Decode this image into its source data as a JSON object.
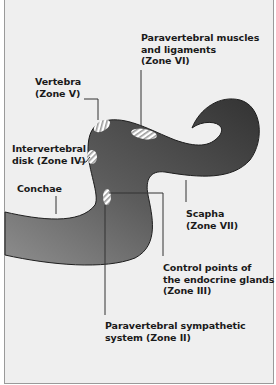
{
  "labels": {
    "zone_vi": "Paravertebral muscles\nand ligaments\n(Zone VI)",
    "zone_v": "Vertebra\n(Zone V)",
    "zone_iv": "Intervertebral\ndisk (Zone IV)",
    "conchae": "Conchae",
    "zone_vii": "Scapha\n(Zone VII)",
    "zone_iii": "Control points of\nthe endocrine glands\n(Zone III)",
    "zone_ii": "Paravertebral sympathetic\nsystem (Zone II)"
  },
  "colors": {
    "background": "#efefef",
    "shape_dark": "#3a3a3a",
    "shape_mid": "#5a5a5a",
    "shape_light": "#8a8a8a",
    "leader_line": "#333333"
  }
}
